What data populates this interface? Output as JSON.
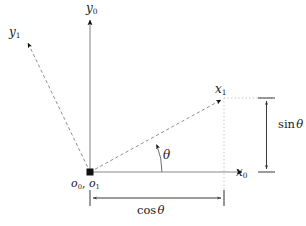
{
  "figure": {
    "background_color": "#ffffff",
    "axis_color": "#808080",
    "dashed_color": "#8c8c8c",
    "dotted_color": "#b0b0b0",
    "arrow_color": "#111111",
    "text_color": "#1a1a1a",
    "width": 306,
    "height": 226
  },
  "labels": {
    "y0": {
      "base": "y",
      "sub": "0"
    },
    "y1": {
      "base": "y",
      "sub": "1"
    },
    "x0": {
      "base": "x",
      "sub": "0"
    },
    "x1": {
      "base": "x",
      "sub": "1"
    },
    "origin_o0": {
      "base": "o",
      "sub": "0"
    },
    "origin_sep": ",",
    "origin_o1": {
      "base": "o",
      "sub": "1"
    },
    "theta": "θ",
    "sin_theta": {
      "fn": "sin",
      "arg": "θ"
    },
    "cos_theta": {
      "fn": "cos",
      "arg": "θ"
    }
  },
  "geometry": {
    "origin": {
      "x": 90,
      "y": 172
    },
    "y0_axis_tip": {
      "x": 90,
      "y": 16
    },
    "x0_axis_tip": {
      "x": 246,
      "y": 172
    },
    "x1_axis_tip": {
      "x": 224,
      "y": 98
    },
    "y1_axis_tip": {
      "x": 25,
      "y": 40
    },
    "projection_x": 224,
    "projection_y": 98,
    "sin_dimension_x": 266,
    "sin_dimension_y_top": 98,
    "sin_dimension_y_bottom": 172,
    "cos_dimension_y": 198,
    "cos_dimension_x_left": 90,
    "cos_dimension_x_right": 224,
    "theta_arc_radius": 72,
    "theta_degrees": 25
  }
}
